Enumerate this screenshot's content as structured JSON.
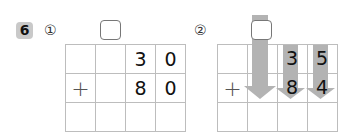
{
  "problem_number": "6",
  "parts": [
    {
      "label": "①",
      "rows": [
        [
          "",
          "",
          "3",
          "0"
        ],
        [
          "+",
          "",
          "8",
          "0"
        ],
        [
          "",
          "",
          "",
          ""
        ]
      ]
    },
    {
      "label": "②",
      "rows": [
        [
          "",
          "",
          "3",
          "5"
        ],
        [
          "+",
          "",
          "8",
          "4"
        ],
        [
          "",
          "",
          "",
          ""
        ]
      ],
      "arrow_columns": [
        1,
        2,
        3
      ]
    }
  ],
  "colors": {
    "arrow": "#b3b3b3",
    "badge": "#c9c9c9",
    "grid_line": "#bdbdbd"
  }
}
